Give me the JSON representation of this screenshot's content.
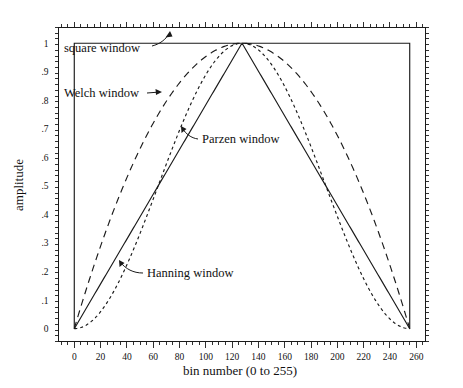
{
  "chart_data": {
    "type": "line",
    "title": "",
    "xlabel": "bin number (0 to 255)",
    "ylabel": "amplitude",
    "xlim": [
      -12,
      267
    ],
    "ylim": [
      -0.045,
      1.055
    ],
    "grid": false,
    "legend_position": "inline-annotations",
    "x_ticks": [
      0,
      20,
      40,
      60,
      80,
      100,
      120,
      140,
      160,
      180,
      200,
      220,
      240,
      260
    ],
    "x_tick_labels": [
      "0",
      "20",
      "40",
      "60",
      "80",
      "100",
      "120",
      "140",
      "160",
      "180",
      "200",
      "220",
      "240",
      "260"
    ],
    "x_minor_interval": 5,
    "y_ticks": [
      0,
      0.1,
      0.2,
      0.3,
      0.4,
      0.5,
      0.6,
      0.7,
      0.8,
      0.9,
      1.0
    ],
    "y_tick_labels": [
      "0",
      ".1",
      ".2",
      ".3",
      ".4",
      ".5",
      ".6",
      ".7",
      ".8",
      ".9",
      "1"
    ],
    "y_minor_interval": 0.02,
    "n_bins": 256,
    "peak_bin": 127.5,
    "series": [
      {
        "name": "square window",
        "style": "solid",
        "formula": "w = 1 for all bins",
        "samples_x": [
          0,
          32,
          64,
          96,
          128,
          160,
          192,
          224,
          255
        ],
        "samples_y": [
          1.0,
          1.0,
          1.0,
          1.0,
          1.0,
          1.0,
          1.0,
          1.0,
          1.0
        ]
      },
      {
        "name": "Welch window",
        "style": "long-dashed",
        "formula": "w = 1 - ((j - 127.5)/127.5)^2",
        "samples_x": [
          0,
          16,
          32,
          48,
          64,
          80,
          96,
          112,
          128,
          144,
          160,
          176,
          192,
          208,
          224,
          240,
          255
        ],
        "samples_y": [
          0.0156,
          0.2462,
          0.4478,
          0.6203,
          0.7638,
          0.8783,
          0.9637,
          1.0,
          1.0,
          0.9923,
          0.936,
          0.8506,
          0.7362,
          0.5927,
          0.4202,
          0.2186,
          0.0156
        ]
      },
      {
        "name": "Parzen window",
        "style": "solid",
        "formula": "w = 1 - |(j - 127.5)/127.5|",
        "samples_x": [
          0,
          32,
          64,
          96,
          128,
          160,
          192,
          224,
          255
        ],
        "samples_y": [
          0.0,
          0.251,
          0.502,
          0.7529,
          0.9961,
          0.7529,
          0.502,
          0.251,
          0.0
        ]
      },
      {
        "name": "Hanning window",
        "style": "short-dashed",
        "formula": "w = 0.5*(1 - cos(2*pi*j/255))",
        "samples_x": [
          0,
          16,
          32,
          48,
          64,
          80,
          96,
          112,
          128,
          144,
          160,
          176,
          192,
          208,
          224,
          240,
          255
        ],
        "samples_y": [
          0.0,
          0.038,
          0.1464,
          0.3087,
          0.5,
          0.6913,
          0.8536,
          0.9619,
          1.0,
          0.9619,
          0.8536,
          0.6913,
          0.5,
          0.3087,
          0.1464,
          0.038,
          0.0
        ]
      }
    ],
    "annotations": [
      {
        "text": "square window",
        "target_series": "square window"
      },
      {
        "text": "Welch window",
        "target_series": "Welch window"
      },
      {
        "text": "Parzen window",
        "target_series": "Parzen window"
      },
      {
        "text": "Hanning window",
        "target_series": "Hanning window"
      }
    ]
  },
  "labels": {
    "xlabel": "bin number (0 to 255)",
    "ylabel": "amplitude",
    "square": "square window",
    "welch": "Welch window",
    "parzen": "Parzen window",
    "hanning": "Hanning window"
  },
  "colors": {
    "ink": "#1a1a1a",
    "background": "#ffffff"
  }
}
